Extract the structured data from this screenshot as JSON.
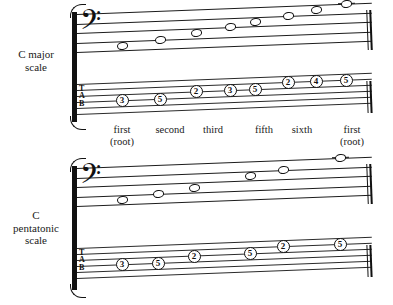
{
  "document": {
    "title": "C major scale and C pentatonic scale - notation and tablature",
    "background_color": "#ffffff",
    "ink_color": "#111111"
  },
  "systems": [
    {
      "id": "c-major",
      "caption_lines": [
        "C major",
        "scale"
      ],
      "clef": "bass-clef",
      "clef_glyph": "𝄢",
      "staff": {
        "line_count": 5,
        "notes": [
          {
            "index": 1,
            "x": 122,
            "step": 0,
            "ledger": false
          },
          {
            "index": 2,
            "x": 160,
            "step": 1,
            "ledger": false
          },
          {
            "index": 3,
            "x": 196,
            "step": 2,
            "ledger": false
          },
          {
            "index": 4,
            "x": 230,
            "step": 3,
            "ledger": false
          },
          {
            "index": 5,
            "x": 255,
            "step": 4,
            "ledger": false
          },
          {
            "index": 6,
            "x": 288,
            "step": 5,
            "ledger": false
          },
          {
            "index": 7,
            "x": 316,
            "step": 6,
            "ledger": false
          },
          {
            "index": 8,
            "x": 346,
            "step": 7,
            "ledger": true
          }
        ]
      },
      "tab": {
        "line_count": 6,
        "letters": [
          "T",
          "A",
          "B"
        ],
        "frets": [
          {
            "x": 122,
            "string": 4,
            "fret": "3"
          },
          {
            "x": 160,
            "string": 4,
            "fret": "5"
          },
          {
            "x": 196,
            "string": 3,
            "fret": "2"
          },
          {
            "x": 230,
            "string": 3,
            "fret": "3"
          },
          {
            "x": 255,
            "string": 3,
            "fret": "5"
          },
          {
            "x": 288,
            "string": 2,
            "fret": "2"
          },
          {
            "x": 316,
            "string": 2,
            "fret": "4"
          },
          {
            "x": 346,
            "string": 2,
            "fret": "5"
          }
        ]
      },
      "degree_labels": [
        {
          "x": 122,
          "lines": [
            "first",
            "(root)"
          ]
        },
        {
          "x": 170,
          "lines": [
            "second",
            ""
          ]
        },
        {
          "x": 213,
          "lines": [
            "third",
            ""
          ]
        },
        {
          "x": 264,
          "lines": [
            "fifth",
            ""
          ]
        },
        {
          "x": 302,
          "lines": [
            "sixth",
            ""
          ]
        },
        {
          "x": 352,
          "lines": [
            "first",
            "(root)"
          ]
        }
      ]
    },
    {
      "id": "c-pentatonic",
      "caption_lines": [
        "C",
        "pentatonic",
        "scale"
      ],
      "clef": "bass-clef",
      "clef_glyph": "𝄢",
      "staff": {
        "line_count": 5,
        "notes": [
          {
            "index": 1,
            "x": 122,
            "step": 0,
            "ledger": false
          },
          {
            "index": 2,
            "x": 158,
            "step": 1,
            "ledger": false
          },
          {
            "index": 3,
            "x": 194,
            "step": 2,
            "ledger": false
          },
          {
            "index": 4,
            "x": 250,
            "step": 4,
            "ledger": false
          },
          {
            "index": 5,
            "x": 283,
            "step": 5,
            "ledger": false
          },
          {
            "index": 6,
            "x": 340,
            "step": 7,
            "ledger": true
          }
        ]
      },
      "tab": {
        "line_count": 6,
        "letters": [
          "T",
          "A",
          "B"
        ],
        "frets": [
          {
            "x": 122,
            "string": 4,
            "fret": "3"
          },
          {
            "x": 158,
            "string": 4,
            "fret": "5"
          },
          {
            "x": 194,
            "string": 3,
            "fret": "2"
          },
          {
            "x": 250,
            "string": 3,
            "fret": "5"
          },
          {
            "x": 283,
            "string": 2,
            "fret": "2"
          },
          {
            "x": 340,
            "string": 2,
            "fret": "5"
          }
        ]
      },
      "degree_labels": []
    }
  ]
}
